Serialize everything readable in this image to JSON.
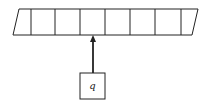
{
  "diagram": {
    "type": "turing-machine-tape",
    "tape": {
      "cell_count": 8,
      "cells": [
        "",
        "",
        "",
        "",
        "",
        "",
        "",
        ""
      ],
      "top_y": 9,
      "bottom_y": 35,
      "left_top_x": 19,
      "left_bottom_x": 13,
      "right_top_x": 198,
      "right_bottom_x": 192,
      "divider_xs": [
        31,
        55,
        80,
        105,
        130,
        155,
        181
      ]
    },
    "head": {
      "label": "q",
      "box": {
        "x": 80,
        "y": 73,
        "width": 25,
        "height": 26
      },
      "arrow": {
        "x": 93,
        "from_y": 73,
        "to_y": 36
      }
    },
    "colors": {
      "stroke": "#222222",
      "background": "#ffffff"
    }
  }
}
